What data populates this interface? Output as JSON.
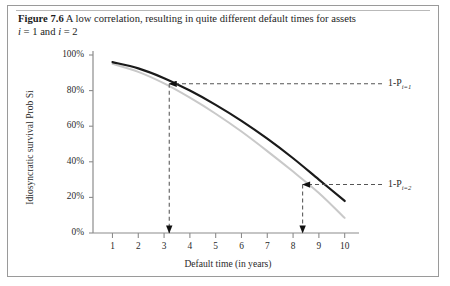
{
  "figure": {
    "number_label": "Figure 7.6",
    "caption_text": "A low correlation, resulting in quite different default times for assets",
    "caption_line2_a": "i",
    "caption_line2_b": " = 1 and ",
    "caption_line2_c": "i",
    "caption_line2_d": " = 2"
  },
  "annotations": {
    "upper": {
      "base": "1-P",
      "sub": "i=1"
    },
    "lower": {
      "base": "1-P",
      "sub": "i=2"
    }
  },
  "colors": {
    "curve_asset1": "#1a1a1a",
    "curve_asset2": "#c9c9c9",
    "axis": "#8c8c8c",
    "dashed": "#555555",
    "frame": "#9a9a9a",
    "text": "#1c1c1c"
  },
  "chart_data": {
    "type": "line",
    "title": "",
    "xlabel": "Default time (in years)",
    "ylabel": "Idiosyncratic survival Prob Si",
    "xlim": [
      0.4,
      10.4
    ],
    "ylim": [
      0,
      1
    ],
    "grid": false,
    "legend_position": "none",
    "xticks": [
      1,
      2,
      3,
      4,
      5,
      6,
      7,
      8,
      9,
      10
    ],
    "xtick_labels": [
      "1",
      "2",
      "3",
      "4",
      "5",
      "6",
      "7",
      "8",
      "9",
      "10"
    ],
    "yticks": [
      0,
      0.2,
      0.4,
      0.6,
      0.8,
      1.0
    ],
    "ytick_labels": [
      "0%",
      "20%",
      "40%",
      "60%",
      "80%",
      "100%"
    ],
    "x": [
      1,
      2,
      3,
      4,
      5,
      6,
      7,
      8,
      9,
      10
    ],
    "series": [
      {
        "name": "asset i=1",
        "color": "#1a1a1a",
        "width": 2.2,
        "values": [
          0.96,
          0.925,
          0.87,
          0.8,
          0.72,
          0.63,
          0.53,
          0.42,
          0.3,
          0.18
        ]
      },
      {
        "name": "asset i=2",
        "color": "#c9c9c9",
        "width": 2.0,
        "values": [
          0.95,
          0.905,
          0.84,
          0.76,
          0.67,
          0.57,
          0.46,
          0.345,
          0.225,
          0.085
        ]
      }
    ],
    "markers": [
      {
        "name": "default-time-asset-1",
        "x": 3.2,
        "y": 0.838,
        "label_ref": "annotations.upper",
        "arrow_down_to_axis": true,
        "arrow_right_to_label": true
      },
      {
        "name": "default-time-asset-2",
        "x": 8.37,
        "y": 0.272,
        "label_ref": "annotations.lower",
        "arrow_down_to_axis": true,
        "arrow_right_to_label": true
      }
    ]
  }
}
